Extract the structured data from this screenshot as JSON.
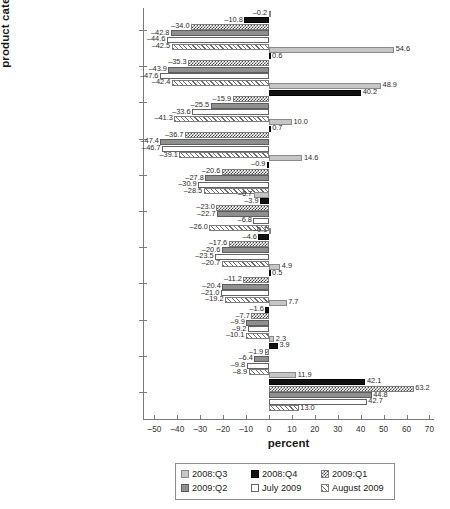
{
  "chart_data": {
    "type": "bar",
    "orientation": "horizontal",
    "title": "",
    "xlabel": "percent",
    "ylabel": "product category",
    "xlim": [
      -55,
      72
    ],
    "xticks": [
      -50,
      -40,
      -30,
      -20,
      -10,
      0,
      10,
      20,
      30,
      40,
      50,
      60,
      70
    ],
    "xticklabels": [
      "–50",
      "–40",
      "–30",
      "–20",
      "–10",
      "0",
      "10",
      "20",
      "30",
      "40",
      "50",
      "60",
      "70"
    ],
    "grid": false,
    "legend_position": "bottom-center",
    "categories": [
      "manufactured goods",
      "mineral fuels, lubricants, and related materials",
      "animal and vegetable oils, fats, and waxes",
      "crude materials, inedible, except fuels",
      "total",
      "beverages and tobacco",
      "machinery and transport equipment",
      "chemicals and related products, not elsewhere specified",
      "food and live animals",
      "miscellaneous manufactured articles",
      "commodities and transactions not classified elsewhere"
    ],
    "category_lines": [
      [
        "manufactured goods"
      ],
      [
        "mineral fuels, lubricants, and",
        "related materials"
      ],
      [
        "animal and vegetable oils,",
        "fats, and waxes"
      ],
      [
        "crude materials, inedible,",
        "except fuels"
      ],
      [
        "total"
      ],
      [
        "beverages and tobacco"
      ],
      [
        "machinery and transport",
        "equipment"
      ],
      [
        "chemicals and related",
        "products, not elsewhere",
        "specified"
      ],
      [
        "food and live animals"
      ],
      [
        "miscellaneous manufactured",
        "articles"
      ],
      [
        "commodities and transactions",
        "not classified elsewhere"
      ]
    ],
    "series": [
      {
        "name": "2008:Q3",
        "style": "light-gray",
        "color": "#c6c6c6",
        "values": [
          -0.2,
          54.6,
          48.9,
          10.0,
          14.6,
          -6.7,
          -0.1,
          4.9,
          7.7,
          2.3,
          11.9
        ],
        "labels": [
          "–0.2",
          "54.6",
          "48.9",
          "10.0",
          "14.6",
          "–6.7",
          "–0.1",
          "4.9",
          "7.7",
          "2.3",
          "11.9"
        ]
      },
      {
        "name": "2008:Q4",
        "style": "black",
        "color": "#111111",
        "values": [
          -10.8,
          0.6,
          40.2,
          0.7,
          -0.9,
          -3.9,
          -4.6,
          0.5,
          -1.6,
          3.9,
          42.1
        ],
        "labels": [
          "–10.8",
          "0.6",
          "40.2",
          "0.7",
          "–0.9",
          "–3.9",
          "–4.6",
          "0.5",
          "–1.6",
          "3.9",
          "42.1"
        ]
      },
      {
        "name": "2009:Q1",
        "style": "checker",
        "color": "#4a4a4a",
        "values": [
          -34.0,
          -35.3,
          -15.9,
          -36.7,
          -20.6,
          -23.0,
          -17.6,
          -11.2,
          -7.7,
          -1.9,
          63.2
        ],
        "labels": [
          "–34.0",
          "–35.3",
          "–15.9",
          "–36.7",
          "–20.6",
          "–23.0",
          "–17.6",
          "–11.2",
          "–7.7",
          "–1.9",
          "63.2"
        ]
      },
      {
        "name": "2009:Q2",
        "style": "medium-gray",
        "color": "#8f8f8f",
        "values": [
          -42.8,
          -43.9,
          -25.5,
          -47.4,
          -27.8,
          -22.7,
          -20.6,
          -20.4,
          -9.9,
          -6.4,
          44.8
        ],
        "labels": [
          "–42.8",
          "–43.9",
          "–25.5",
          "–47.4",
          "–27.8",
          "–22.7",
          "–20.6",
          "–20.4",
          "–9.9",
          "–6.4",
          "44.8"
        ]
      },
      {
        "name": "July 2009",
        "style": "white",
        "color": "#ffffff",
        "values": [
          -44.6,
          -47.6,
          -33.6,
          -46.7,
          -30.9,
          -6.8,
          -23.5,
          -21.0,
          -9.2,
          -9.8,
          42.7
        ],
        "labels": [
          "–44.6",
          "–47.6",
          "–33.6",
          "–46.7",
          "–30.9",
          "–6.8",
          "–23.5",
          "–21.0",
          "–9.2",
          "–9.8",
          "42.7"
        ]
      },
      {
        "name": "August 2009",
        "style": "hatch",
        "color": "#6e6e6e",
        "values": [
          -42.5,
          -42.4,
          -41.3,
          -39.1,
          -28.5,
          -26.0,
          -20.7,
          -19.2,
          -10.1,
          -8.9,
          13.0
        ],
        "labels": [
          "–42.5",
          "–42.4",
          "–41.3",
          "–39.1",
          "–28.5",
          "–26.0",
          "–20.7",
          "–19.2",
          "–10.1",
          "–8.9",
          "13.0"
        ]
      }
    ]
  },
  "legend": {
    "items": [
      {
        "label": "2008:Q3",
        "style": "s0"
      },
      {
        "label": "2008:Q4",
        "style": "s1"
      },
      {
        "label": "2009:Q1",
        "style": "s2"
      },
      {
        "label": "2009:Q2",
        "style": "s3"
      },
      {
        "label": "July 2009",
        "style": "s4"
      },
      {
        "label": "August 2009",
        "style": "s5"
      }
    ]
  }
}
